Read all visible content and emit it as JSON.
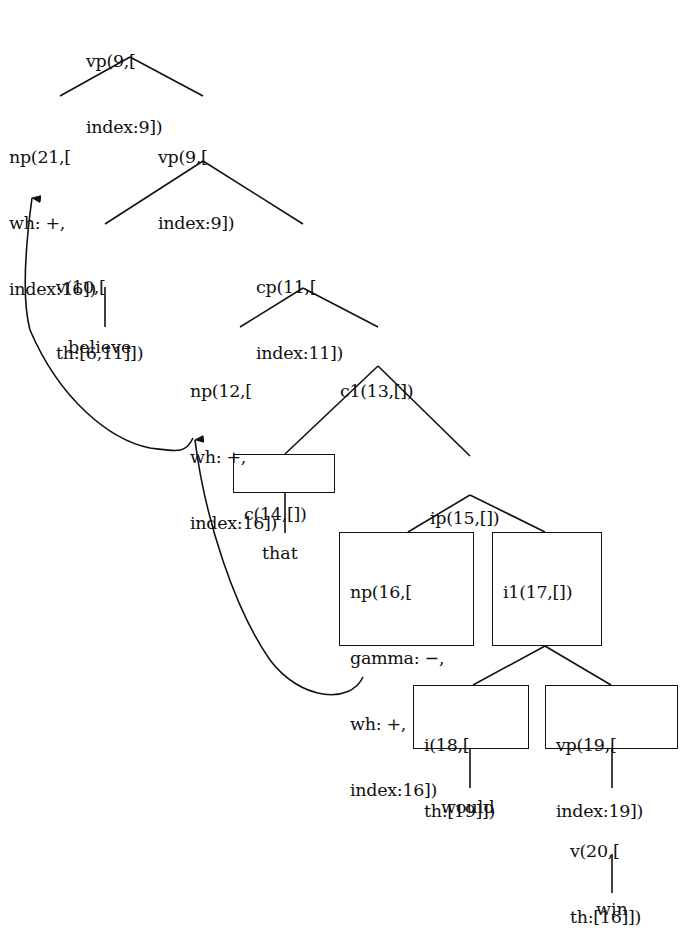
{
  "diagram": {
    "type": "parse-tree",
    "nodes": [
      {
        "id": "n_vp9_root",
        "lines": [
          "vp(9,[",
          "index:9])"
        ]
      },
      {
        "id": "n_np21",
        "lines": [
          "np(21,[",
          "wh: +,",
          "index:16])"
        ]
      },
      {
        "id": "n_vp9",
        "lines": [
          "vp(9,[",
          "index:9])"
        ]
      },
      {
        "id": "n_v10",
        "lines": [
          "v(10,[",
          "th:[6,11]])"
        ]
      },
      {
        "id": "n_cp11",
        "lines": [
          "cp(11,[",
          "index:11])"
        ]
      },
      {
        "id": "n_np12",
        "lines": [
          "np(12,[",
          "wh: +,",
          "index:16])"
        ]
      },
      {
        "id": "n_c1_13",
        "lines": [
          "c1(13,[])"
        ]
      },
      {
        "id": "n_c14",
        "lines": [
          "c(14,[])"
        ],
        "boxed": true
      },
      {
        "id": "n_ip15",
        "lines": [
          "ip(15,[])"
        ]
      },
      {
        "id": "n_np16",
        "lines": [
          "np(16,[",
          "gamma: −,",
          "wh: +,",
          "index:16])"
        ],
        "boxed": true
      },
      {
        "id": "n_i1_17",
        "lines": [
          "i1(17,[])"
        ],
        "boxed": true
      },
      {
        "id": "n_i18",
        "lines": [
          "i(18,[",
          "th:[19]])"
        ],
        "boxed": true
      },
      {
        "id": "n_vp19",
        "lines": [
          "vp(19,[",
          "index:19])"
        ],
        "boxed": true
      },
      {
        "id": "n_v20",
        "lines": [
          "v(20,[",
          "th:[16]])"
        ]
      }
    ],
    "leaves": {
      "believe": "believe",
      "that": "that",
      "would": "would",
      "win": "win"
    },
    "edges": [
      [
        "vp9_root",
        "np21"
      ],
      [
        "vp9_root",
        "vp9"
      ],
      [
        "vp9",
        "v10"
      ],
      [
        "vp9",
        "cp11"
      ],
      [
        "v10",
        "believe"
      ],
      [
        "cp11",
        "np12"
      ],
      [
        "cp11",
        "c1_13"
      ],
      [
        "c1_13",
        "c14"
      ],
      [
        "c1_13",
        "ip15"
      ],
      [
        "c14",
        "that"
      ],
      [
        "ip15",
        "np16"
      ],
      [
        "ip15",
        "i1_17"
      ],
      [
        "i1_17",
        "i18"
      ],
      [
        "i1_17",
        "vp19"
      ],
      [
        "i18",
        "would"
      ],
      [
        "vp19",
        "v20"
      ],
      [
        "v20",
        "win"
      ]
    ],
    "movement_arrows": [
      {
        "from": "np16",
        "to": "np12"
      },
      {
        "from": "np12",
        "to": "np21"
      }
    ],
    "line_color": "#111111"
  }
}
